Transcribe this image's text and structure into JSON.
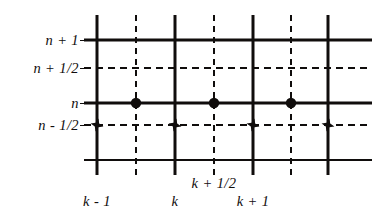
{
  "figure": {
    "type": "staggered-grid-stencil-diagram",
    "width": 385,
    "height": 216,
    "background_color": "#ffffff",
    "line_color": "#100d0c",
    "marker_color": "#100d0c"
  },
  "y_labels": [
    {
      "text": "n + 1",
      "y": 40,
      "line_style": "solid"
    },
    {
      "text": "n + 1/2",
      "y": 68,
      "line_style": "dashed"
    },
    {
      "text": "n",
      "y": 103,
      "line_style": "solid"
    },
    {
      "text": "n - 1/2",
      "y": 125,
      "line_style": "dashed"
    }
  ],
  "x_labels": [
    {
      "text": "k - 1",
      "x": 97,
      "y": 193,
      "line_style": "solid"
    },
    {
      "text": "k",
      "x": 175,
      "y": 193,
      "line_style": "solid"
    },
    {
      "text": "k + 1/2",
      "x": 214,
      "y": 175,
      "line_style": "dashed"
    },
    {
      "text": "k + 1",
      "x": 253,
      "y": 193,
      "line_style": "solid"
    }
  ],
  "grid": {
    "vertical_solid_x": [
      97,
      175,
      253,
      328
    ],
    "vertical_dashed_x": [
      136,
      214,
      291
    ],
    "vertical_top": 15,
    "vertical_bottom": 175,
    "horizontal_solid_y": [
      40,
      103,
      160
    ],
    "horizontal_dashed_y": [
      68,
      125
    ],
    "horizontal_left": 84,
    "horizontal_right": 372
  },
  "markers": {
    "circles": {
      "symbol": "filled-circle",
      "row_label": "n",
      "points": [
        {
          "x": 136,
          "y": 103
        },
        {
          "x": 214,
          "y": 103
        },
        {
          "x": 291,
          "y": 103
        }
      ]
    },
    "stars": {
      "symbol": "filled-star-cross",
      "row_label": "n - 1/2",
      "points": [
        {
          "x": 97,
          "y": 125
        },
        {
          "x": 175,
          "y": 125
        },
        {
          "x": 253,
          "y": 125
        },
        {
          "x": 328,
          "y": 125
        }
      ]
    }
  }
}
